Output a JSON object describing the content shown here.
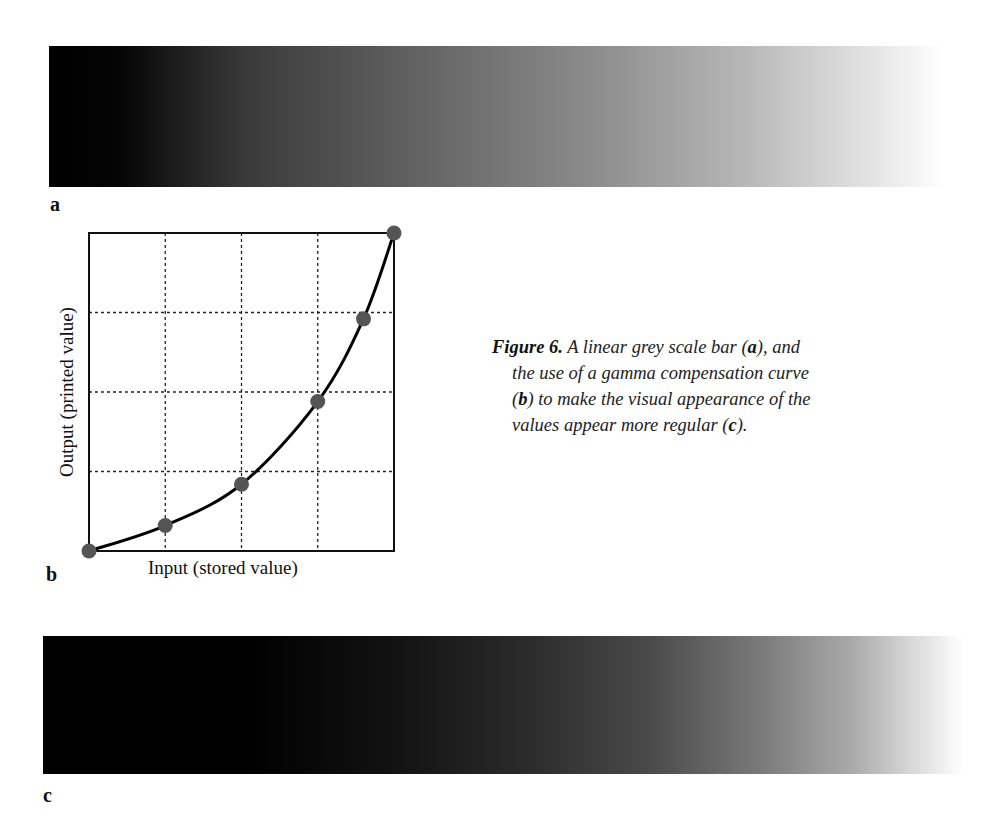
{
  "panels": {
    "a": {
      "label": "a",
      "description": "linear grey scale bar"
    },
    "b": {
      "label": "b",
      "description": "gamma compensation curve"
    },
    "c": {
      "label": "c",
      "description": "gamma-compensated grey scale bar"
    }
  },
  "caption": {
    "figure_label": "Figure 6.",
    "line1": " A linear grey scale bar (",
    "a_ref": "a",
    "line1_end": "), and",
    "line2": "the use of a gamma compensation curve",
    "line3_start": "(",
    "b_ref": "b",
    "line3_end": ") to make the visual appearance of the",
    "line4_start": "values appear more regular (",
    "c_ref": "c",
    "line4_end": ")."
  },
  "chart_data": {
    "type": "line",
    "title": "",
    "xlabel": "Input (stored value)",
    "ylabel": "Output (printed value)",
    "x": [
      0,
      0.25,
      0.5,
      0.75,
      0.9,
      1.0
    ],
    "values": [
      0,
      0.08,
      0.21,
      0.47,
      0.73,
      1.0
    ],
    "xlim": [
      0,
      1
    ],
    "ylim": [
      0,
      1
    ],
    "grid": true,
    "grid_style": "dashed",
    "x_grid": [
      0.25,
      0.5,
      0.75
    ],
    "y_grid": [
      0.25,
      0.5,
      0.75
    ],
    "markers": true,
    "marker_color": "#555555",
    "line_color": "#000000",
    "tick_labels": false
  }
}
